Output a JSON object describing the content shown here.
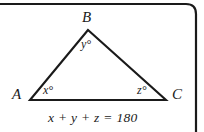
{
  "figure": {
    "type": "geometry-diagram",
    "shape": "triangle",
    "background_color": "#ffffff",
    "line_color": "#1a1a1a",
    "text_color": "#1a1a1a",
    "border": {
      "present": true,
      "sides": "top and right with rounded top-right corner",
      "color": "#1a1a1a"
    }
  },
  "vertices": [
    {
      "id": "B",
      "label": "B",
      "x": 88,
      "y": 30,
      "label_x": 82,
      "label_y": 10
    },
    {
      "id": "A",
      "label": "A",
      "x": 30,
      "y": 100,
      "label_x": 12,
      "label_y": 87
    },
    {
      "id": "C",
      "label": "C",
      "x": 166,
      "y": 100,
      "label_x": 172,
      "label_y": 87
    }
  ],
  "angles": [
    {
      "id": "y",
      "label": "y°",
      "at_vertex": "B",
      "label_x": 81,
      "label_y": 38
    },
    {
      "id": "x",
      "label": "x°",
      "at_vertex": "A",
      "label_x": 43,
      "label_y": 84
    },
    {
      "id": "z",
      "label": "z°",
      "at_vertex": "C",
      "label_x": 137,
      "label_y": 84
    }
  ],
  "equation": {
    "text": "x + y + z = 180"
  }
}
